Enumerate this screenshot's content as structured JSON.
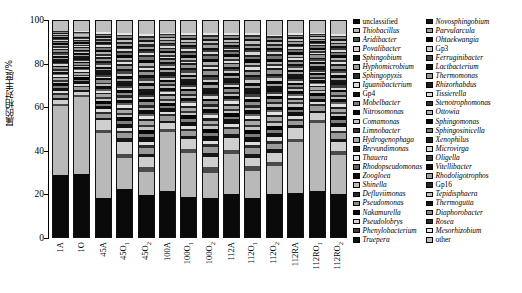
{
  "chart_data": {
    "type": "bar",
    "subtype": "stacked-100-percent",
    "title": "",
    "xlabel": "",
    "ylabel": "属的相对丰度/%",
    "ylim": [
      0,
      100
    ],
    "yticks": [
      0,
      20,
      40,
      60,
      80,
      100
    ],
    "grid": false,
    "legend_position": "right",
    "categories": [
      "1A",
      "1O",
      "45A",
      "45O₁",
      "45O₂",
      "100A",
      "100O₁",
      "100O₂",
      "112A",
      "112O₁",
      "112O₂",
      "112RA",
      "112RO₁",
      "112RO₂"
    ],
    "category_labels_html": [
      {
        "base": "1A",
        "sub": ""
      },
      {
        "base": "1O",
        "sub": ""
      },
      {
        "base": "45A",
        "sub": ""
      },
      {
        "base": "45O",
        "sub": "1"
      },
      {
        "base": "45O",
        "sub": "2"
      },
      {
        "base": "100A",
        "sub": ""
      },
      {
        "base": "100O",
        "sub": "1"
      },
      {
        "base": "100O",
        "sub": "2"
      },
      {
        "base": "112A",
        "sub": ""
      },
      {
        "base": "112O",
        "sub": "1"
      },
      {
        "base": "112O",
        "sub": "2"
      },
      {
        "base": "112RA",
        "sub": ""
      },
      {
        "base": "112RO",
        "sub": "1"
      },
      {
        "base": "112RO",
        "sub": "2"
      }
    ],
    "series": [
      {
        "name": "unclassified",
        "color": "#0a0a0a",
        "values": [
          30.0,
          29.8,
          19.3,
          24.0,
          22.0,
          22.0,
          20.5,
          20.0,
          20.3,
          20.0,
          19.5,
          20.2,
          20.0,
          19.8
        ]
      },
      {
        "name": "Thiobacillus",
        "color": "#b9b9b9",
        "values": [
          33.5,
          37.0,
          31.5,
          15.5,
          12.0,
          28.0,
          22.0,
          13.0,
          19.0,
          14.0,
          13.0,
          23.0,
          29.0,
          18.0
        ]
      },
      {
        "name": "Aridibacter",
        "color": "#4a4a4a",
        "values": [
          1.2,
          1.0,
          1.5,
          2.0,
          2.5,
          1.5,
          2.0,
          3.0,
          2.0,
          2.5,
          2.0,
          1.5,
          1.5,
          2.0
        ]
      },
      {
        "name": "Povalibacter",
        "color": "#cfcfcf",
        "values": [
          2.0,
          1.5,
          5.0,
          6.0,
          5.0,
          3.0,
          5.0,
          5.5,
          6.0,
          4.0,
          4.0,
          5.0,
          3.0,
          4.0
        ]
      },
      {
        "name": "Sphingobium",
        "color": "#171717",
        "values": [
          1.0,
          0.8,
          1.0,
          1.5,
          1.8,
          1.2,
          1.5,
          2.0,
          1.5,
          2.0,
          1.8,
          1.2,
          1.0,
          1.5
        ]
      },
      {
        "name": "Hyphomicrobium",
        "color": "#9a9a9a",
        "values": [
          1.5,
          1.2,
          2.0,
          2.5,
          3.0,
          2.0,
          2.5,
          3.0,
          2.5,
          3.0,
          2.5,
          2.0,
          1.8,
          2.5
        ]
      },
      {
        "name": "Sphingopyxis",
        "color": "#2b2b2b",
        "values": [
          0.8,
          0.7,
          1.0,
          1.2,
          1.5,
          1.0,
          1.2,
          1.5,
          1.2,
          1.5,
          1.3,
          1.0,
          0.9,
          1.2
        ]
      },
      {
        "name": "Iguanibacterium",
        "color": "#dcdcdc",
        "values": [
          1.0,
          0.9,
          1.2,
          1.5,
          1.8,
          1.2,
          1.5,
          1.8,
          1.5,
          1.8,
          1.5,
          1.2,
          1.0,
          1.5
        ]
      },
      {
        "name": "Gp4",
        "color": "#101010",
        "values": [
          1.5,
          1.3,
          1.8,
          2.2,
          2.5,
          1.8,
          2.2,
          2.5,
          2.0,
          2.5,
          2.2,
          1.8,
          1.5,
          2.0
        ]
      },
      {
        "name": "Mobelbacter",
        "color": "#7e7e7e",
        "values": [
          0.9,
          0.8,
          1.1,
          1.4,
          1.6,
          1.1,
          1.4,
          1.6,
          1.3,
          1.6,
          1.4,
          1.1,
          1.0,
          1.3
        ]
      },
      {
        "name": "Nitrosomonas",
        "color": "#050505",
        "values": [
          1.3,
          1.1,
          1.5,
          1.8,
          2.0,
          1.5,
          1.8,
          2.0,
          1.7,
          2.0,
          1.8,
          1.5,
          1.3,
          1.7
        ]
      },
      {
        "name": "Comamonas",
        "color": "#c4c4c4",
        "values": [
          0.8,
          0.7,
          1.0,
          1.2,
          1.4,
          1.0,
          1.2,
          1.4,
          1.1,
          1.4,
          1.2,
          1.0,
          0.8,
          1.1
        ]
      },
      {
        "name": "Limnobacter",
        "color": "#333333",
        "values": [
          0.7,
          0.6,
          0.9,
          1.1,
          1.3,
          0.9,
          1.1,
          1.3,
          1.0,
          1.3,
          1.1,
          0.9,
          0.7,
          1.0
        ]
      },
      {
        "name": "Hydrogenophaga",
        "color": "#a8a8a8",
        "values": [
          1.0,
          0.9,
          1.2,
          1.5,
          1.7,
          1.2,
          1.5,
          1.7,
          1.4,
          1.7,
          1.5,
          1.2,
          1.0,
          1.4
        ]
      },
      {
        "name": "Brevundimonas",
        "color": "#1d1d1d",
        "values": [
          0.6,
          0.5,
          0.8,
          1.0,
          1.2,
          0.8,
          1.0,
          1.2,
          0.9,
          1.2,
          1.0,
          0.8,
          0.6,
          0.9
        ]
      },
      {
        "name": "Thauera",
        "color": "#e2e2e2",
        "values": [
          0.8,
          0.7,
          1.0,
          1.3,
          1.5,
          1.0,
          1.3,
          1.5,
          1.2,
          1.5,
          1.3,
          1.0,
          0.8,
          1.2
        ]
      },
      {
        "name": "Rhodopseudomonas",
        "color": "#5e5e5e",
        "values": [
          0.7,
          0.6,
          0.9,
          1.1,
          1.3,
          0.9,
          1.1,
          1.3,
          1.0,
          1.3,
          1.1,
          0.9,
          0.7,
          1.0
        ]
      },
      {
        "name": "Zoogloea",
        "color": "#0d0d0d",
        "values": [
          1.1,
          0.9,
          1.3,
          1.6,
          1.9,
          1.3,
          1.6,
          1.9,
          1.5,
          1.9,
          1.6,
          1.3,
          1.1,
          1.5
        ]
      },
      {
        "name": "Shinella",
        "color": "#bdbdbd",
        "values": [
          0.6,
          0.5,
          0.8,
          1.0,
          1.2,
          0.8,
          1.0,
          1.2,
          0.9,
          1.2,
          1.0,
          0.8,
          0.6,
          0.9
        ]
      },
      {
        "name": "Defluviimonas",
        "color": "#262626",
        "values": [
          0.7,
          0.6,
          0.9,
          1.1,
          1.3,
          0.9,
          1.1,
          1.3,
          1.0,
          1.3,
          1.1,
          0.9,
          0.7,
          1.0
        ]
      },
      {
        "name": "Pseudomonas",
        "color": "#8d8d8d",
        "values": [
          0.9,
          0.8,
          1.1,
          1.4,
          1.6,
          1.1,
          1.4,
          1.6,
          1.3,
          1.6,
          1.4,
          1.1,
          0.9,
          1.3
        ]
      },
      {
        "name": "Nakamurella",
        "color": "#070707",
        "values": [
          0.8,
          0.7,
          1.0,
          1.2,
          1.4,
          1.0,
          1.2,
          1.4,
          1.1,
          1.4,
          1.2,
          1.0,
          0.8,
          1.1
        ]
      },
      {
        "name": "Pseudolobrys",
        "color": "#d4d4d4",
        "values": [
          0.6,
          0.5,
          0.8,
          1.0,
          1.2,
          0.8,
          1.0,
          1.2,
          0.9,
          1.2,
          1.0,
          0.8,
          0.6,
          0.9
        ]
      },
      {
        "name": "Phenylobacterium",
        "color": "#3d3d3d",
        "values": [
          0.7,
          0.6,
          0.9,
          1.1,
          1.3,
          0.9,
          1.1,
          1.3,
          1.0,
          1.3,
          1.1,
          0.9,
          0.7,
          1.0
        ]
      },
      {
        "name": "Truepera",
        "color": "#121212",
        "values": [
          0.8,
          0.7,
          1.0,
          1.2,
          1.4,
          1.0,
          1.2,
          1.4,
          1.1,
          1.4,
          1.2,
          1.0,
          0.8,
          1.1
        ]
      },
      {
        "name": "Novosphingobium",
        "color": "#161616",
        "values": [
          1.0,
          0.9,
          1.2,
          1.5,
          1.8,
          1.2,
          1.5,
          1.8,
          1.4,
          1.8,
          1.5,
          1.2,
          1.0,
          1.4
        ]
      },
      {
        "name": "Parvularcula",
        "color": "#a0a0a0",
        "values": [
          0.6,
          0.5,
          0.8,
          1.0,
          1.2,
          0.8,
          1.0,
          1.2,
          0.9,
          1.2,
          1.0,
          0.8,
          0.6,
          0.9
        ]
      },
      {
        "name": "Ohtaekwangia",
        "color": "#0b0b0b",
        "values": [
          0.9,
          0.8,
          1.1,
          1.4,
          1.6,
          1.1,
          1.4,
          1.6,
          1.3,
          1.6,
          1.4,
          1.1,
          0.9,
          1.3
        ]
      },
      {
        "name": "Gp3",
        "color": "#cacaca",
        "values": [
          0.7,
          0.6,
          0.9,
          1.1,
          1.3,
          0.9,
          1.1,
          1.3,
          1.0,
          1.3,
          1.1,
          0.9,
          0.7,
          1.0
        ]
      },
      {
        "name": "Ferruginibacter",
        "color": "#444444",
        "values": [
          0.8,
          0.7,
          1.0,
          1.2,
          1.5,
          1.0,
          1.2,
          1.5,
          1.1,
          1.5,
          1.2,
          1.0,
          0.8,
          1.1
        ]
      },
      {
        "name": "Lactbacterium",
        "color": "#111111",
        "values": [
          0.6,
          0.5,
          0.8,
          1.0,
          1.2,
          0.8,
          1.0,
          1.2,
          0.9,
          1.2,
          1.0,
          0.8,
          0.6,
          0.9
        ]
      },
      {
        "name": "Thermomonas",
        "color": "#949494",
        "values": [
          0.9,
          0.8,
          1.1,
          1.4,
          1.6,
          1.1,
          1.4,
          1.6,
          1.2,
          1.6,
          1.4,
          1.1,
          0.9,
          1.2
        ]
      },
      {
        "name": "Rhizorhabdus",
        "color": "#1a1a1a",
        "values": [
          0.6,
          0.5,
          0.8,
          1.0,
          1.2,
          0.8,
          1.0,
          1.2,
          0.9,
          1.2,
          1.0,
          0.8,
          0.6,
          0.9
        ]
      },
      {
        "name": "Tissierella",
        "color": "#dedede",
        "values": [
          0.5,
          0.4,
          0.7,
          0.9,
          1.1,
          0.7,
          0.9,
          1.1,
          0.8,
          1.1,
          0.9,
          0.7,
          0.5,
          0.8
        ]
      },
      {
        "name": "Stenotrophomonas",
        "color": "#2f2f2f",
        "values": [
          0.7,
          0.6,
          0.9,
          1.1,
          1.3,
          0.9,
          1.1,
          1.3,
          1.0,
          1.3,
          1.1,
          0.9,
          0.7,
          1.0
        ]
      },
      {
        "name": "Ottowia",
        "color": "#b2b2b2",
        "values": [
          0.6,
          0.5,
          0.8,
          1.0,
          1.2,
          0.8,
          1.0,
          1.2,
          0.9,
          1.2,
          1.0,
          0.8,
          0.6,
          0.9
        ]
      },
      {
        "name": "Sphingomonas",
        "color": "#080808",
        "values": [
          1.0,
          0.9,
          1.2,
          1.5,
          1.8,
          1.2,
          1.5,
          1.8,
          1.4,
          1.8,
          1.5,
          1.2,
          1.0,
          1.4
        ]
      },
      {
        "name": "Sphingosinicella",
        "color": "#767676",
        "values": [
          0.6,
          0.5,
          0.8,
          1.0,
          1.2,
          0.8,
          1.0,
          1.2,
          0.9,
          1.2,
          1.0,
          0.8,
          0.6,
          0.9
        ]
      },
      {
        "name": "Xenophilus",
        "color": "#202020",
        "values": [
          0.5,
          0.4,
          0.7,
          0.9,
          1.1,
          0.7,
          0.9,
          1.1,
          0.8,
          1.1,
          0.9,
          0.7,
          0.5,
          0.8
        ]
      },
      {
        "name": "Microvirga",
        "color": "#d8d8d8",
        "values": [
          0.6,
          0.5,
          0.8,
          1.0,
          1.2,
          0.8,
          1.0,
          1.2,
          0.9,
          1.2,
          1.0,
          0.8,
          0.6,
          0.9
        ]
      },
      {
        "name": "Oligella",
        "color": "#3a3a3a",
        "values": [
          0.5,
          0.4,
          0.7,
          0.9,
          1.1,
          0.7,
          0.9,
          1.1,
          0.8,
          1.1,
          0.9,
          0.7,
          0.5,
          0.8
        ]
      },
      {
        "name": "Vitellibacter",
        "color": "#0e0e0e",
        "values": [
          0.6,
          0.5,
          0.8,
          1.0,
          1.2,
          0.8,
          1.0,
          1.2,
          0.9,
          1.2,
          1.0,
          0.8,
          0.6,
          0.9
        ]
      },
      {
        "name": "Rhodoligotrophos",
        "color": "#9e9e9e",
        "values": [
          0.5,
          0.4,
          0.7,
          0.9,
          1.1,
          0.7,
          0.9,
          1.1,
          0.8,
          1.1,
          0.9,
          0.7,
          0.5,
          0.8
        ]
      },
      {
        "name": "Gp16",
        "color": "#232323",
        "values": [
          0.5,
          0.4,
          0.7,
          0.9,
          1.1,
          0.7,
          0.9,
          1.1,
          0.8,
          1.1,
          0.9,
          0.7,
          0.5,
          0.8
        ]
      },
      {
        "name": "Tepidisphaera",
        "color": "#c0c0c0",
        "values": [
          0.6,
          0.5,
          0.8,
          1.0,
          1.2,
          0.8,
          1.0,
          1.2,
          0.9,
          1.2,
          1.0,
          0.8,
          0.6,
          0.9
        ]
      },
      {
        "name": "Thermogutta",
        "color": "#151515",
        "values": [
          0.5,
          0.4,
          0.7,
          0.9,
          1.1,
          0.7,
          0.9,
          1.1,
          0.8,
          1.1,
          0.9,
          0.7,
          0.5,
          0.8
        ]
      },
      {
        "name": "Diaphorobacter",
        "color": "#888888",
        "values": [
          0.5,
          0.4,
          0.7,
          0.9,
          1.1,
          0.7,
          0.9,
          1.1,
          0.8,
          1.1,
          0.9,
          0.7,
          0.5,
          0.8
        ]
      },
      {
        "name": "Rosea",
        "color": "#2a2a2a",
        "values": [
          0.4,
          0.4,
          0.6,
          0.8,
          1.0,
          0.6,
          0.8,
          1.0,
          0.7,
          1.0,
          0.8,
          0.6,
          0.4,
          0.7
        ]
      },
      {
        "name": "Mesorhizobium",
        "color": "#e6e6e6",
        "values": [
          0.4,
          0.4,
          0.6,
          0.8,
          1.0,
          0.6,
          0.8,
          1.0,
          0.7,
          1.0,
          0.8,
          0.6,
          0.4,
          0.7
        ]
      },
      {
        "name": "other",
        "color": "#bfbfbf",
        "values": [
          5.4,
          5.6,
          6.4,
          6.9,
          7.6,
          6.4,
          6.9,
          7.0,
          6.7,
          7.0,
          6.9,
          6.4,
          6.0,
          6.8
        ]
      }
    ]
  },
  "axis": {
    "y_label": "属的相对丰度/%",
    "y_ticks": [
      "100",
      "80",
      "60",
      "40",
      "20",
      "0"
    ]
  },
  "legend": {
    "column1": [
      "unclassified",
      "Thiobacillus",
      "Aridibacter",
      "Povalibacter",
      "Sphingobium",
      "Hyphomicrobium",
      "Sphingopyxis",
      "Iguanibacterium",
      "Gp4",
      "Mobelbacter",
      "Nitrosomonas",
      "Comamonas",
      "Limnobacter",
      "Hydrogenophaga",
      "Brevundimonas",
      "Thauera",
      "Rhodopseudomonas",
      "Zoogloea",
      "Shinella",
      "Defluviimonas",
      "Pseudomonas",
      "Nakamurella",
      "Pseudolobrys",
      "Phenylobacterium",
      "Truepera"
    ],
    "column2": [
      "Novosphingobium",
      "Parvularcula",
      "Ohtaekwangia",
      "Gp3",
      "Ferruginibacter",
      "Lactbacterium",
      "Thermomonas",
      "Rhizorhabdus",
      "Tissierella",
      "Stenotrophomonas",
      "Ottowia",
      "Sphingomonas",
      "Sphingosinicella",
      "Xenophilus",
      "Microvirga",
      "Oligella",
      "Vitellibacter",
      "Rhodoligotrophos",
      "Gp16",
      "Tepidisphaera",
      "Thermogutta",
      "Diaphorobacter",
      "Rosea",
      "Mesorhizobium",
      "other"
    ],
    "non_italic_entries": [
      "unclassified",
      "Gp4",
      "Gp3",
      "Gp16",
      "other"
    ]
  }
}
